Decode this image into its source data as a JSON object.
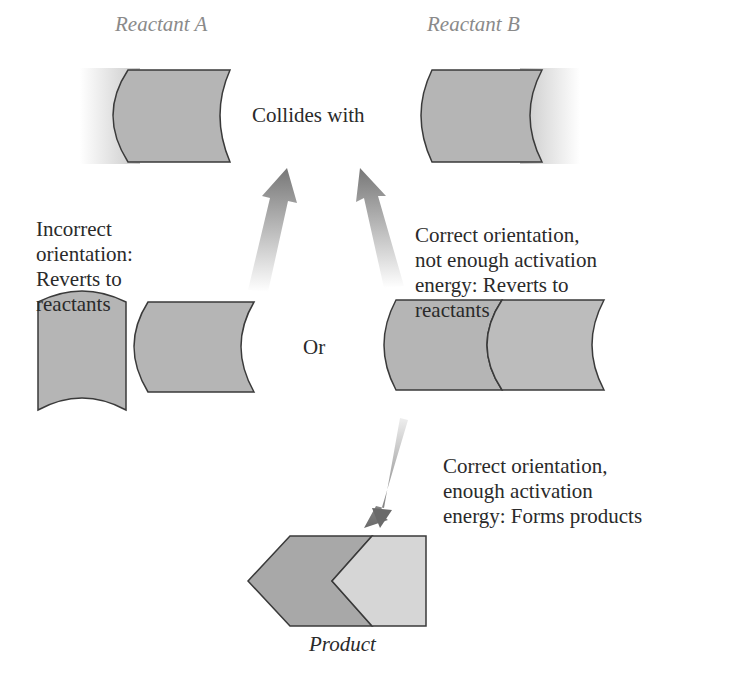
{
  "header_fragment": "…ing products,",
  "reactants": {
    "a_label": "Reactant A",
    "b_label": "Reactant B",
    "collides": "Collides with"
  },
  "outcomes": {
    "incorrect": [
      "Incorrect",
      "orientation:",
      "Reverts to",
      "reactants"
    ],
    "not_enough": [
      "Correct orientation,",
      "not enough activation",
      "energy: Reverts to",
      "reactants"
    ],
    "or": "Or",
    "forms": [
      "Correct orientation,",
      "enough activation",
      "energy: Forms products"
    ]
  },
  "product_label": "Product",
  "colors": {
    "shape_fill": "#b5b5b5",
    "shape_light": "#d6d6d6",
    "stroke": "#3a3a3a",
    "label_gray": "#8a8a8a",
    "text": "#2a2a2a"
  }
}
